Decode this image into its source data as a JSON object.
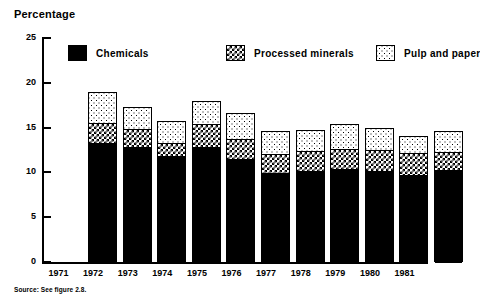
{
  "chart_data": {
    "type": "bar",
    "stacked": true,
    "title": "Percentage",
    "xlabel": "",
    "ylabel": "Percentage",
    "ylim": [
      0,
      25
    ],
    "yticks": [
      0,
      5,
      10,
      15,
      20,
      25
    ],
    "grid": false,
    "legend_position": "top-inside",
    "categories": [
      "1971",
      "1972",
      "1973",
      "1974",
      "1975",
      "1976",
      "1977",
      "1978",
      "1979",
      "1980",
      "1981"
    ],
    "series": [
      {
        "name": "Chemicals",
        "fill": "solid-black",
        "values": [
          13.3,
          12.8,
          11.8,
          12.8,
          11.5,
          9.9,
          10.1,
          10.4,
          10.2,
          9.7,
          10.3
        ]
      },
      {
        "name": "Processed minerals",
        "fill": "checkerboard",
        "values": [
          2.2,
          2.0,
          1.5,
          2.6,
          2.2,
          2.2,
          2.3,
          2.2,
          2.3,
          2.5,
          2.0
        ]
      },
      {
        "name": "Pulp and paper",
        "fill": "light-dots",
        "values": [
          3.5,
          2.5,
          2.4,
          2.6,
          2.9,
          2.5,
          2.3,
          2.8,
          2.4,
          1.9,
          2.3
        ]
      }
    ],
    "totals": [
      19.0,
      17.3,
      15.7,
      18.0,
      16.6,
      14.6,
      14.7,
      15.4,
      14.9,
      14.1,
      14.6
    ],
    "annotations": [
      "Source: See figure 2.8."
    ]
  },
  "axis": {
    "y_tick_labels": [
      "25",
      "20",
      "15",
      "10",
      "5",
      "0"
    ]
  },
  "legend": {
    "items": [
      {
        "label": "Chemicals",
        "swatch": "solid-black-swatch"
      },
      {
        "label": "Processed minerals",
        "swatch": "checkerboard-swatch"
      },
      {
        "label": "Pulp and paper",
        "swatch": "light-dots-swatch"
      }
    ]
  },
  "source": {
    "text": "Source: See figure 2.8."
  }
}
